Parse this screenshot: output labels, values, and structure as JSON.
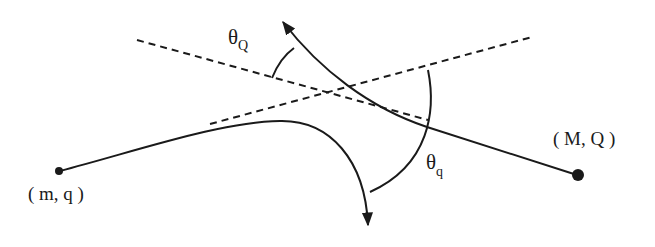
{
  "diagram": {
    "particle_small": {
      "label": "( m, q )"
    },
    "particle_large": {
      "label": "( M, Q )"
    },
    "angle_Q": {
      "symbol": "θ",
      "subscript": "Q"
    },
    "angle_q": {
      "symbol": "θ",
      "subscript": "q"
    },
    "colors": {
      "stroke": "#1a1a1a",
      "background": "#ffffff"
    }
  }
}
